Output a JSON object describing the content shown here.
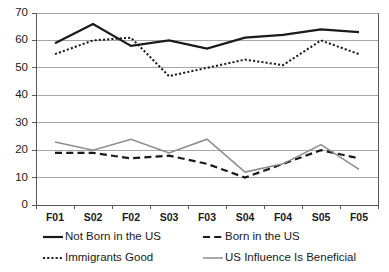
{
  "chart_data": {
    "type": "line",
    "title": "",
    "xlabel": "",
    "ylabel": "",
    "categories": [
      "F01",
      "S02",
      "F02",
      "S03",
      "F03",
      "S04",
      "F04",
      "S05",
      "F05"
    ],
    "ylim": [
      0,
      70
    ],
    "yticks": [
      0,
      10,
      20,
      30,
      40,
      50,
      60,
      70
    ],
    "ytick_labels": [
      "0",
      "10",
      "20",
      "30",
      "40",
      "50",
      "60",
      "70"
    ],
    "grid": true,
    "grid_axis": "y",
    "legend_position": "bottom",
    "series": [
      {
        "name": "Not Born in the US",
        "style": "solid",
        "color": "#1a1a1a",
        "width": 2.2,
        "values": [
          59,
          66,
          58,
          60,
          57,
          61,
          62,
          64,
          63
        ]
      },
      {
        "name": "Born in the US",
        "style": "dashed",
        "color": "#1a1a1a",
        "width": 2.2,
        "values": [
          19,
          19,
          17,
          18,
          15,
          10,
          15,
          20,
          17
        ]
      },
      {
        "name": "Immigrants Good",
        "style": "dotted",
        "color": "#1a1a1a",
        "width": 2.0,
        "values": [
          55,
          60,
          61,
          47,
          50,
          53,
          51,
          60,
          55
        ]
      },
      {
        "name": "US Influence Is Beneficial",
        "style": "solid",
        "color": "#8c8c8c",
        "width": 1.5,
        "values": [
          23,
          20,
          24,
          19,
          24,
          12,
          15,
          22,
          13
        ]
      }
    ]
  },
  "legend": {
    "entries": [
      {
        "label": "Not Born in the US",
        "swatch": "solid-black-line-icon"
      },
      {
        "label": "Born in the US",
        "swatch": "dashed-black-line-icon"
      },
      {
        "label": "Immigrants Good",
        "swatch": "dotted-black-line-icon"
      },
      {
        "label": "US Influence Is Beneficial",
        "swatch": "solid-gray-line-icon"
      }
    ]
  },
  "colors": {
    "axis": "#595959",
    "grid": "#a6a6a6",
    "series_dark": "#1a1a1a",
    "series_gray": "#8c8c8c",
    "background": "#ffffff"
  }
}
